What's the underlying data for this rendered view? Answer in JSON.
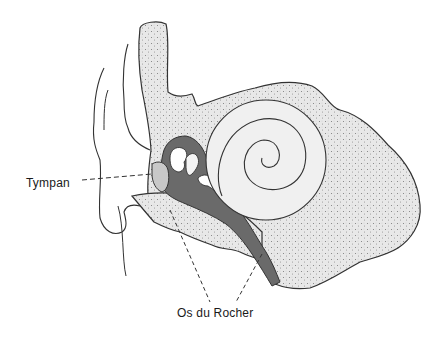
{
  "diagram": {
    "labels": {
      "tympan": "Tympan",
      "os_du_rocher": "Os du Rocher"
    },
    "colors": {
      "bone_fill": "#e6e6e6",
      "bone_dots": "#8a8a8a",
      "cavity_dark": "#6a6a6a",
      "cochlea_fill": "#f0f0f0",
      "tympan_fill": "#c8c8c8",
      "outline": "#333333",
      "background": "#ffffff"
    },
    "parts": [
      "outer-ear",
      "ear-canal",
      "tympan",
      "middle-ear-ossicles",
      "cochlea",
      "eustachian-tube",
      "temporal-bone"
    ]
  }
}
